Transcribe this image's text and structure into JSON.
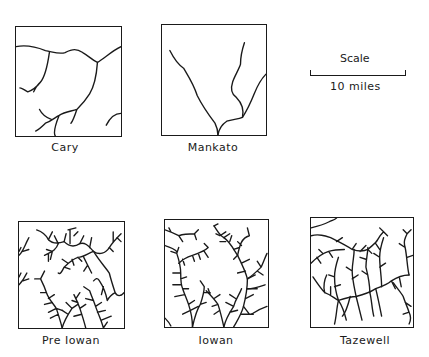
{
  "panels": [
    {
      "id": "cary",
      "label": "Cary"
    },
    {
      "id": "mankato",
      "label": "Mankato"
    },
    {
      "id": "pre-iowan",
      "label": "Pre Iowan"
    },
    {
      "id": "iowan",
      "label": "Iowan"
    },
    {
      "id": "tazewell",
      "label": "Tazewell"
    }
  ],
  "scale": {
    "title": "Scale",
    "distance": "10 miles"
  }
}
